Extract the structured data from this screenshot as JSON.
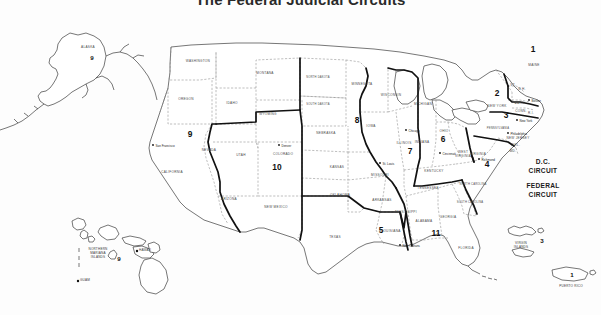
{
  "title": "The Federal Judicial Circuits",
  "map": {
    "name": "united-states-federal-judicial-circuits-map",
    "circuit_labels": [
      {
        "id": "1",
        "text": "1",
        "x": 533,
        "y": 52,
        "size": "lg"
      },
      {
        "id": "2",
        "text": "2",
        "x": 497,
        "y": 96,
        "size": "lg"
      },
      {
        "id": "3",
        "text": "3",
        "x": 506,
        "y": 118,
        "size": "lg"
      },
      {
        "id": "4",
        "text": "4",
        "x": 487,
        "y": 167,
        "size": "lg"
      },
      {
        "id": "5",
        "text": "5",
        "x": 381,
        "y": 233,
        "size": "lg"
      },
      {
        "id": "6",
        "text": "6",
        "x": 443,
        "y": 142,
        "size": "lg"
      },
      {
        "id": "7",
        "text": "7",
        "x": 410,
        "y": 154,
        "size": "lg"
      },
      {
        "id": "8",
        "text": "8",
        "x": 357,
        "y": 123,
        "size": "lg"
      },
      {
        "id": "9",
        "text": "9",
        "x": 190,
        "y": 137,
        "size": "lg"
      },
      {
        "id": "10",
        "text": "10",
        "x": 277,
        "y": 170,
        "size": "lg"
      },
      {
        "id": "11",
        "text": "11",
        "x": 436,
        "y": 236,
        "size": "lg"
      },
      {
        "id": "9-alaska",
        "text": "9",
        "x": 92,
        "y": 60,
        "size": "sm"
      },
      {
        "id": "9-hawaii",
        "text": "9",
        "x": 119,
        "y": 261,
        "size": "sm"
      },
      {
        "id": "3-virgin-islands",
        "text": "3",
        "x": 542,
        "y": 243,
        "size": "sm"
      },
      {
        "id": "1-puerto-rico",
        "text": "1",
        "x": 572,
        "y": 277,
        "size": "sm"
      }
    ],
    "word_circuits": [
      {
        "id": "dc",
        "line1": "D.C.",
        "line2": "CIRCUIT",
        "x": 543,
        "y": 164
      },
      {
        "id": "federal",
        "line1": "FEDERAL",
        "line2": "CIRCUIT",
        "x": 543,
        "y": 188
      }
    ],
    "states": [
      {
        "name": "WASHINGTON",
        "x": 198,
        "y": 62
      },
      {
        "name": "OREGON",
        "x": 186,
        "y": 100
      },
      {
        "name": "IDAHO",
        "x": 232,
        "y": 104
      },
      {
        "name": "MONTANA",
        "x": 265,
        "y": 74
      },
      {
        "name": "WYOMING",
        "x": 268,
        "y": 115
      },
      {
        "name": "NEVADA",
        "x": 209,
        "y": 151
      },
      {
        "name": "UTAH",
        "x": 241,
        "y": 156
      },
      {
        "name": "CALIFORNIA",
        "x": 172,
        "y": 173
      },
      {
        "name": "ARIZONA",
        "x": 229,
        "y": 200
      },
      {
        "name": "COLORADO",
        "x": 283,
        "y": 155
      },
      {
        "name": "NEW MEXICO",
        "x": 276,
        "y": 208
      },
      {
        "name": "NORTH DAKOTA",
        "x": 318,
        "y": 78
      },
      {
        "name": "SOUTH DAKOTA",
        "x": 318,
        "y": 105
      },
      {
        "name": "NEBRASKA",
        "x": 326,
        "y": 134
      },
      {
        "name": "KANSAS",
        "x": 337,
        "y": 168
      },
      {
        "name": "OKLAHOMA",
        "x": 340,
        "y": 196
      },
      {
        "name": "TEXAS",
        "x": 335,
        "y": 238
      },
      {
        "name": "MINNESOTA",
        "x": 362,
        "y": 85
      },
      {
        "name": "IOWA",
        "x": 371,
        "y": 127
      },
      {
        "name": "MISSOURI",
        "x": 380,
        "y": 176
      },
      {
        "name": "ARKANSAS",
        "x": 382,
        "y": 201
      },
      {
        "name": "LOUISIANA",
        "x": 391,
        "y": 232
      },
      {
        "name": "WISCONSIN",
        "x": 391,
        "y": 96
      },
      {
        "name": "ILLINOIS",
        "x": 404,
        "y": 144
      },
      {
        "name": "MICHIGAN",
        "x": 423,
        "y": 105
      },
      {
        "name": "INDIANA",
        "x": 422,
        "y": 143
      },
      {
        "name": "OHIO",
        "x": 444,
        "y": 132
      },
      {
        "name": "KENTUCKY",
        "x": 434,
        "y": 172
      },
      {
        "name": "TENNESSEE",
        "x": 428,
        "y": 189
      },
      {
        "name": "MISSISSIPPI",
        "x": 406,
        "y": 213
      },
      {
        "name": "ALABAMA",
        "x": 424,
        "y": 222
      },
      {
        "name": "GEORGIA",
        "x": 448,
        "y": 218
      },
      {
        "name": "FLORIDA",
        "x": 466,
        "y": 249
      },
      {
        "name": "SOUTH CAROLINA",
        "x": 470,
        "y": 203
      },
      {
        "name": "NORTH CAROLINA",
        "x": 473,
        "y": 185
      },
      {
        "name": "VIRGINIA",
        "x": 478,
        "y": 155
      },
      {
        "name": "WEST",
        "x": 463,
        "y": 153
      },
      {
        "name": "VIRGINIA",
        "x": 463,
        "y": 157
      },
      {
        "name": "PENNSYLVANIA",
        "x": 498,
        "y": 129
      },
      {
        "name": "NEW YORK",
        "x": 497,
        "y": 107
      },
      {
        "name": "NEW JERSEY",
        "x": 518,
        "y": 139
      },
      {
        "name": "MAINE",
        "x": 534,
        "y": 66
      },
      {
        "name": "MASS.",
        "x": 520,
        "y": 104
      },
      {
        "name": "CONN.",
        "x": 521,
        "y": 112
      },
      {
        "name": "R.I.",
        "x": 531,
        "y": 114
      },
      {
        "name": "VT.",
        "x": 513,
        "y": 86
      },
      {
        "name": "N.H.",
        "x": 522,
        "y": 90
      },
      {
        "name": "DEL.",
        "x": 516,
        "y": 146
      },
      {
        "name": "MD.",
        "x": 513,
        "y": 152
      },
      {
        "name": "ALASKA",
        "x": 88,
        "y": 48
      }
    ],
    "cities": [
      {
        "name": "San Francisco",
        "x": 153,
        "y": 146,
        "dx": 2.5
      },
      {
        "name": "Denver",
        "x": 279,
        "y": 146,
        "dx": 2.5
      },
      {
        "name": "St. Louis",
        "x": 380,
        "y": 164,
        "dx": 2.5
      },
      {
        "name": "Chicago",
        "x": 406,
        "y": 131,
        "dx": 2.5
      },
      {
        "name": "Cincinnati",
        "x": 440,
        "y": 154,
        "dx": 2.5
      },
      {
        "name": "Richmond",
        "x": 479,
        "y": 160,
        "dx": 2.5
      },
      {
        "name": "New Orleans",
        "x": 400,
        "y": 246,
        "dx": 2.5
      },
      {
        "name": "Boston",
        "x": 529,
        "y": 101,
        "dx": 2.5
      },
      {
        "name": "New York",
        "x": 517,
        "y": 121,
        "dx": 2.5
      },
      {
        "name": "Philadelphia",
        "x": 508,
        "y": 134,
        "dx": 2.5
      }
    ],
    "territories": [
      {
        "name": "NORTHERN MARIANA ISLANDS",
        "lines": [
          "NORTHERN",
          "MARIANA",
          "ISLANDS"
        ],
        "x": 98,
        "y": 250
      },
      {
        "name": "GUAM",
        "lines": [
          "GUAM"
        ],
        "x": 85,
        "y": 281,
        "dot": true
      },
      {
        "name": "HAWAII",
        "lines": [
          "HAWAII"
        ],
        "x": 145,
        "y": 251,
        "dot": true
      },
      {
        "name": "VIRGIN ISLANDS",
        "lines": [
          "VIRGIN",
          "ISLANDS"
        ],
        "x": 521,
        "y": 244
      },
      {
        "name": "PUERTO RICO",
        "lines": [
          "PUERTO RICO"
        ],
        "x": 571,
        "y": 287
      }
    ]
  }
}
